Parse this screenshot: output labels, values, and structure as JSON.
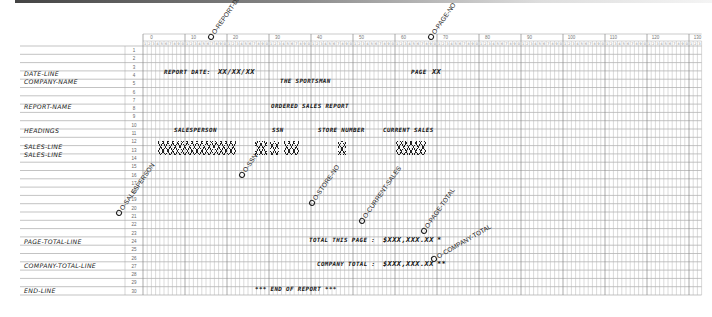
{
  "chart_data": {
    "type": "table",
    "columns": {
      "start": 0,
      "end": 132,
      "tens_labels": [
        "0",
        "10",
        "20",
        "30",
        "40",
        "50",
        "60",
        "70",
        "80",
        "90",
        "100",
        "110",
        "120",
        "130"
      ]
    },
    "rows": {
      "start": 1,
      "end": 30
    },
    "record_labels": [
      {
        "row": 1,
        "label": "DATE-LINE"
      },
      {
        "row": 2,
        "label": "COMPANY-NAME"
      },
      {
        "row": 5,
        "label": "REPORT-NAME"
      },
      {
        "row": 8,
        "label": "HEADINGS"
      },
      {
        "row": 10,
        "label": "SALES-LINE"
      },
      {
        "row": 11,
        "label": "SALES-LINE"
      },
      {
        "row": 23,
        "label": "PAGE-TOTAL-LINE"
      },
      {
        "row": 26,
        "label": "COMPANY-TOTAL-LINE"
      },
      {
        "row": 30,
        "label": "END-LINE"
      }
    ],
    "literals": [
      {
        "row": 1,
        "col": 5,
        "text": "REPORT DATE:"
      },
      {
        "row": 1,
        "col": 18,
        "text": "XX/XX/XX"
      },
      {
        "row": 1,
        "col": 64,
        "text": "PAGE"
      },
      {
        "row": 1,
        "col": 69,
        "text": "XX"
      },
      {
        "row": 2,
        "col": 33,
        "text": "THE SPORTSMAN"
      },
      {
        "row": 5,
        "col": 31,
        "text": "ORDERED SALES REPORT"
      },
      {
        "row": 8,
        "col": 10,
        "text": "SALESPERSON"
      },
      {
        "row": 8,
        "col": 33,
        "text": "SSN"
      },
      {
        "row": 8,
        "col": 43,
        "text": "STORE NUMBER"
      },
      {
        "row": 8,
        "col": 58,
        "text": "CURRENT SALES"
      },
      {
        "row": 23,
        "col": 41,
        "text": "TOTAL THIS PAGE :"
      },
      {
        "row": 23,
        "col": 56,
        "text": "$XXX,XXX.XX"
      },
      {
        "row": 23,
        "col": 70,
        "text": "*"
      },
      {
        "row": 26,
        "col": 45,
        "text": "COMPANY TOTAL :"
      },
      {
        "row": 26,
        "col": 56,
        "text": "$XXX,XXX.XX"
      },
      {
        "row": 26,
        "col": 70,
        "text": "**"
      },
      {
        "row": 30,
        "col": 26,
        "text": "*** END OF REPORT ***"
      }
    ],
    "x_fields": [
      {
        "rows": [
          10,
          11
        ],
        "col_start": 5,
        "col_end": 24,
        "name": "SALESPERSON"
      },
      {
        "rows": [
          10,
          11
        ],
        "col_start": 29,
        "col_end": 31
      },
      {
        "rows": [
          10,
          11
        ],
        "col_start": 33,
        "col_end": 34
      },
      {
        "rows": [
          10,
          11
        ],
        "col_start": 36,
        "col_end": 39
      },
      {
        "rows": [
          10,
          11
        ],
        "col_start": 47,
        "col_end": 48
      },
      {
        "rows": [
          10,
          11
        ],
        "col_start": 60,
        "col_end": 67,
        "text": "$X,XXX.XX"
      }
    ],
    "annotations": [
      "O-REPORT-DATE",
      "O-PAGE-NO",
      "O-SALESPERSON",
      "O-SSN",
      "O-STORE-NO",
      "O-CURRENT-SALES",
      "O-PAGE-TOTAL",
      "O-COMPANY-TOTAL"
    ]
  },
  "labels": {
    "date_line": "DATE-LINE",
    "company_name": "COMPANY-NAME",
    "report_name": "REPORT-NAME",
    "headings": "HEADINGS",
    "sales_line_1": "SALES-LINE",
    "sales_line_2": "SALES-LINE",
    "page_total_line": "PAGE-TOTAL-LINE",
    "company_total_line": "COMPANY-TOTAL-LINE",
    "end_line": "END-LINE"
  },
  "text": {
    "report_date": "REPORT DATE:",
    "date_mask": "XX/XX/XX",
    "page": "PAGE",
    "page_mask": "XX",
    "company": "THE SPORTSMAN",
    "report_title": "ORDERED SALES REPORT",
    "h_salesperson": "SALESPERSON",
    "h_ssn": "SSN",
    "h_store": "STORE NUMBER",
    "h_sales": "CURRENT SALES",
    "sales_mask": "$X,XXX.XX",
    "total_page": "TOTAL THIS PAGE :",
    "page_total_mask": "$XXX,XXX.XX",
    "star1": "*",
    "company_total": "COMPANY TOTAL :",
    "company_total_mask": "$XXX,XXX.XX",
    "star2": "**",
    "end": "*** END OF REPORT ***"
  },
  "annotations": {
    "report_date": "O-REPORT-DATE",
    "page_no": "O-PAGE-NO",
    "salesperson": "O-SALESPERSON",
    "ssn": "O-SSN",
    "store_no": "O-STORE-NO",
    "current_sales": "O-CURRENT-SALES",
    "page_total": "O-PAGE-TOTAL",
    "company_total": "O-COMPANY-TOTAL"
  }
}
